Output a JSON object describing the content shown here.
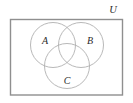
{
  "figure": {
    "type": "venn-diagram",
    "sets_count": 3,
    "background_color": "#ffffff",
    "width": 133,
    "height": 103
  },
  "universe": {
    "label": "U",
    "label_x": 113,
    "label_y": 13,
    "rect": {
      "x": 10.5,
      "y": 19.5,
      "width": 112,
      "height": 75.5
    },
    "border_color": "#8f8f8f",
    "border_width": 1.4,
    "fill_color": "#ffffff"
  },
  "circles": [
    {
      "label": "A",
      "cx": 53,
      "cy": 45,
      "r": 22.5,
      "label_x": 45,
      "label_y": 44,
      "stroke_color": "#b0b0b0",
      "stroke_width": 0.9
    },
    {
      "label": "B",
      "cx": 81,
      "cy": 45,
      "r": 22.5,
      "label_x": 90,
      "label_y": 44,
      "stroke_color": "#b0b0b0",
      "stroke_width": 0.9
    },
    {
      "label": "C",
      "cx": 67,
      "cy": 66,
      "r": 22.5,
      "label_x": 67,
      "label_y": 84,
      "stroke_color": "#b0b0b0",
      "stroke_width": 0.9
    }
  ]
}
